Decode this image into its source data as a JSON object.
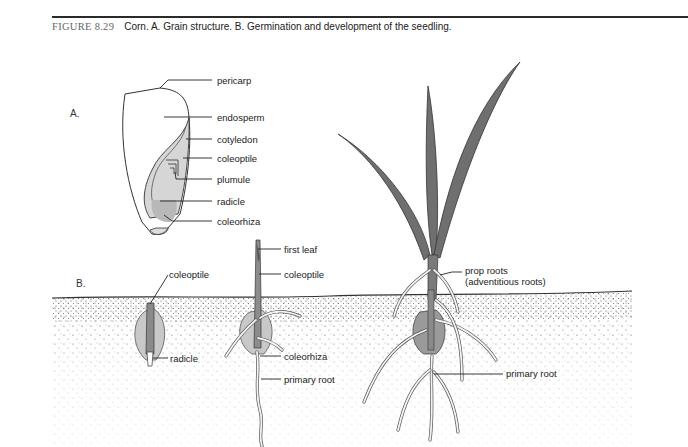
{
  "caption": {
    "figure_number": "FIGURE 8.29",
    "text": "Corn. A. Grain structure. B. Germination and development of the seedling."
  },
  "panels": {
    "a": {
      "label": "A.",
      "labels": [
        "pericarp",
        "endosperm",
        "cotyledon",
        "coleoptile",
        "plumule",
        "radicle",
        "coleorhiza"
      ]
    },
    "b": {
      "label": "B.",
      "stage1": {
        "labels": [
          "coleoptile",
          "radicle"
        ]
      },
      "stage2": {
        "labels": [
          "first leaf",
          "coleoptile",
          "coleorhiza",
          "primary root"
        ]
      },
      "stage3": {
        "labels": [
          "prop roots",
          "(adventitious roots)",
          "primary root"
        ]
      }
    }
  },
  "colors": {
    "leaf": "#6f6f6f",
    "seed_gray": "#c8c8c8",
    "embryo_gray": "#dadada",
    "soil_dots": "#444444"
  }
}
